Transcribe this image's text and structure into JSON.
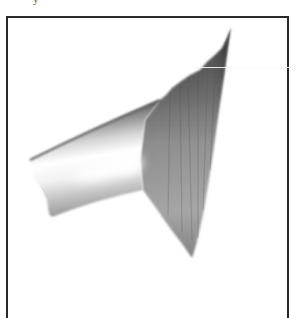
{
  "figure": {
    "caption_fragment": "y",
    "render_style": "grayscale shaded surface",
    "frame": {
      "border_color": "#2a2a2a",
      "background": "#ffffff"
    },
    "shape": {
      "colors": {
        "dark": "#3a3a3a",
        "mid": "#8a8a8a",
        "light": "#d8d8d8",
        "highlight": "#ffffff"
      }
    }
  }
}
